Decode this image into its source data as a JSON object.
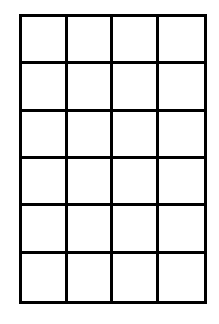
{
  "diagram": {
    "type": "grid",
    "rows": 6,
    "columns": 4,
    "line_color": "#000000",
    "fill_color": "#ffffff",
    "cells": [
      [
        "",
        "",
        "",
        ""
      ],
      [
        "",
        "",
        "",
        ""
      ],
      [
        "",
        "",
        "",
        ""
      ],
      [
        "",
        "",
        "",
        ""
      ],
      [
        "",
        "",
        "",
        ""
      ],
      [
        "",
        "",
        "",
        ""
      ]
    ]
  }
}
